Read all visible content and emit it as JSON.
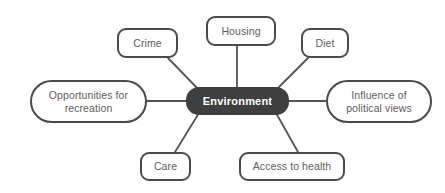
{
  "diagram": {
    "type": "mind-map",
    "title": "Environment",
    "center": {
      "label": "Environment",
      "fill_color": "#3f3f3f",
      "text_color": "#ffffff",
      "x": 186,
      "y": 87,
      "w": 103,
      "h": 28
    },
    "node_style": {
      "fill_color": "#ffffff",
      "border_color": "#4a4a4a",
      "text_color": "#5d5d5d",
      "edge_color": "#545454"
    },
    "nodes": [
      {
        "id": "housing",
        "label": "Housing",
        "lines": [
          "Housing"
        ],
        "shape": "rect",
        "x": 206,
        "y": 16,
        "w": 70,
        "h": 30
      },
      {
        "id": "crime",
        "label": "Crime",
        "lines": [
          "Crime"
        ],
        "shape": "rect",
        "x": 117,
        "y": 28,
        "w": 61,
        "h": 30
      },
      {
        "id": "diet",
        "label": "Diet",
        "lines": [
          "Diet"
        ],
        "shape": "rect",
        "x": 301,
        "y": 28,
        "w": 48,
        "h": 30
      },
      {
        "id": "opportunities",
        "label": "Opportunities for recreation",
        "lines": [
          "Opportunities for",
          "recreation"
        ],
        "shape": "pill",
        "x": 30,
        "y": 80,
        "w": 117,
        "h": 43
      },
      {
        "id": "influence",
        "label": "Influence of political views",
        "lines": [
          "Influence of",
          "political views"
        ],
        "shape": "pill",
        "x": 326,
        "y": 80,
        "w": 106,
        "h": 43
      },
      {
        "id": "care",
        "label": "Care",
        "lines": [
          "Care"
        ],
        "shape": "rect",
        "x": 140,
        "y": 152,
        "w": 51,
        "h": 29
      },
      {
        "id": "access",
        "label": "Access to health",
        "lines": [
          "Access to health"
        ],
        "shape": "rect",
        "x": 239,
        "y": 152,
        "w": 106,
        "h": 29
      }
    ],
    "edges": [
      {
        "from": "center",
        "to": "housing",
        "x1": 237,
        "y1": 88,
        "x2": 237,
        "y2": 46
      },
      {
        "from": "center",
        "to": "crime",
        "x1": 199,
        "y1": 90,
        "x2": 168,
        "y2": 58
      },
      {
        "from": "center",
        "to": "diet",
        "x1": 276,
        "y1": 90,
        "x2": 308,
        "y2": 58
      },
      {
        "from": "center",
        "to": "opportunities",
        "x1": 186,
        "y1": 101,
        "x2": 147,
        "y2": 101
      },
      {
        "from": "center",
        "to": "influence",
        "x1": 289,
        "y1": 101,
        "x2": 326,
        "y2": 101
      },
      {
        "from": "center",
        "to": "care",
        "x1": 199,
        "y1": 113,
        "x2": 175,
        "y2": 152
      },
      {
        "from": "center",
        "to": "access",
        "x1": 276,
        "y1": 113,
        "x2": 298,
        "y2": 152
      }
    ]
  }
}
